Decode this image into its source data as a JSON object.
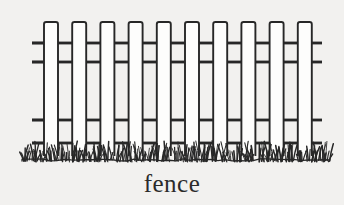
{
  "figure": {
    "name": "fence-line-drawing",
    "caption": "fence",
    "background_color": "#f2f1ef",
    "ink_color": "#272727",
    "fill_color": "#fdfdfc"
  },
  "fence": {
    "picket_count": 10,
    "picket_width": 14,
    "picket_pitch": 28.2,
    "picket_first_left": 44,
    "picket_top": 22,
    "picket_bottom": 156,
    "rail_left": 32,
    "rail_right": 322,
    "rail_thickness": 2.4,
    "rails": [
      {
        "name": "upper-rail-top",
        "y": 43
      },
      {
        "name": "upper-rail-bottom",
        "y": 62
      },
      {
        "name": "lower-rail-top",
        "y": 120
      },
      {
        "name": "lower-rail-bottom",
        "y": 143
      }
    ]
  },
  "grass": {
    "name": "grass-line",
    "baseline_y": 160,
    "tuft_count": 64,
    "band_top": 140,
    "band_bottom": 166
  },
  "chart_data": {
    "type": "table",
    "title": "fence",
    "categories": [
      "picket",
      "rail",
      "grass"
    ],
    "values": [
      10,
      4,
      1
    ],
    "xlabel": "",
    "ylabel": ""
  }
}
